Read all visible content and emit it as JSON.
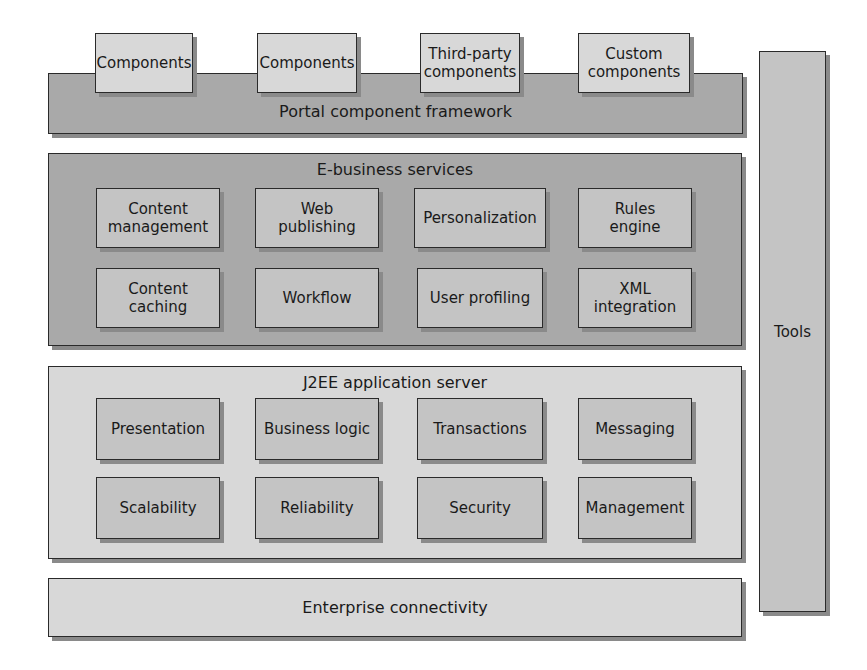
{
  "top_components": [
    {
      "label": "Components"
    },
    {
      "label": "Components"
    },
    {
      "label": "Third-party\ncomponents"
    },
    {
      "label": "Custom\ncomponents"
    }
  ],
  "portal_framework": {
    "label": "Portal component framework"
  },
  "tools": {
    "label": "Tools"
  },
  "ebusiness": {
    "title": "E-business services",
    "row1": [
      {
        "label": "Content\nmanagement"
      },
      {
        "label": "Web\npublishing"
      },
      {
        "label": "Personalization"
      },
      {
        "label": "Rules\nengine"
      }
    ],
    "row2": [
      {
        "label": "Content\ncaching"
      },
      {
        "label": "Workflow"
      },
      {
        "label": "User profiling"
      },
      {
        "label": "XML\nintegration"
      }
    ]
  },
  "j2ee": {
    "title": "J2EE application server",
    "row1": [
      {
        "label": "Presentation"
      },
      {
        "label": "Business logic"
      },
      {
        "label": "Transactions"
      },
      {
        "label": "Messaging"
      }
    ],
    "row2": [
      {
        "label": "Scalability"
      },
      {
        "label": "Reliability"
      },
      {
        "label": "Security"
      },
      {
        "label": "Management"
      }
    ]
  },
  "enterprise": {
    "label": "Enterprise connectivity"
  },
  "colors": {
    "dark_fill": "#a9a9a9",
    "mid_fill": "#c4c4c4",
    "light_fill": "#d8d8d8",
    "border": "#2a2a2a",
    "shadow": "#8a8a8a"
  }
}
